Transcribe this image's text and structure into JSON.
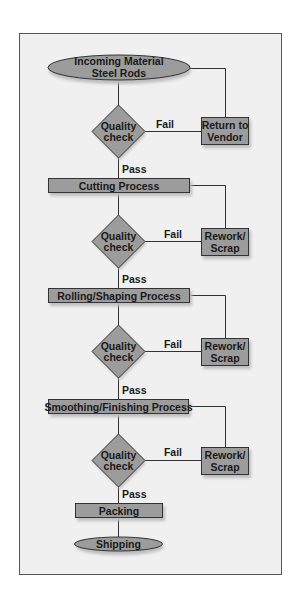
{
  "colors": {
    "frame_bg": "#f0f0f0",
    "frame_border": "#555555",
    "shape_fill": "#9c9c9c",
    "shape_border": "#333333",
    "shadow": "#bdbdbd",
    "line": "#333333"
  },
  "flowchart": {
    "start": {
      "line1": "Incoming Material",
      "line2": "Steel Rods"
    },
    "return_box": {
      "line1": "Return to",
      "line2": "Vendor"
    },
    "quality_checks": [
      {
        "line1": "Quality",
        "line2": "check",
        "fail_label": "Fail",
        "pass_label": "Pass"
      },
      {
        "line1": "Quality",
        "line2": "check",
        "fail_label": "Fail",
        "pass_label": "Pass"
      },
      {
        "line1": "Quality",
        "line2": "check",
        "fail_label": "Fail",
        "pass_label": "Pass"
      },
      {
        "line1": "Quality",
        "line2": "check",
        "fail_label": "Fail",
        "pass_label": "Pass"
      }
    ],
    "processes": [
      {
        "label": "Cutting Process"
      },
      {
        "label": "Rolling/Shaping Process"
      },
      {
        "label": "Smoothing/Finishing Process"
      },
      {
        "label": "Packing"
      }
    ],
    "rework_boxes": [
      {
        "line1": "Rework/",
        "line2": "Scrap"
      },
      {
        "line1": "Rework/",
        "line2": "Scrap"
      },
      {
        "line1": "Rework/",
        "line2": "Scrap"
      }
    ],
    "end": {
      "label": "Shipping"
    }
  }
}
